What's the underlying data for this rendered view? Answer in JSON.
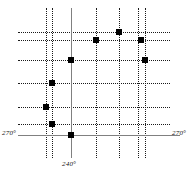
{
  "chart_data": {
    "type": "scatter",
    "title": "",
    "xlabel": "",
    "ylabel": "",
    "xlim": [
      0,
      193
    ],
    "ylim": [
      0,
      175
    ],
    "grid": true,
    "grid_style": "dotted",
    "legend": "none",
    "axis_color": "#808080",
    "grid_color": "#1a1a1a",
    "marker_color": "#000000",
    "marker_shape": "square",
    "annotations": [
      {
        "text": "270°",
        "position": "left-of-horizontal-axis"
      },
      {
        "text": "270°",
        "position": "right-of-horizontal-axis"
      },
      {
        "text": "240°",
        "position": "below-vertical-axis"
      }
    ],
    "axes": {
      "vertical_axis_x": 71,
      "horizontal_axis_y": 135,
      "vertical_axis_top": 8,
      "vertical_axis_bottom": 158,
      "horizontal_axis_left": 18,
      "horizontal_axis_right": 180
    },
    "gridlines_vertical_x": [
      46,
      52,
      96,
      119,
      138,
      145
    ],
    "gridlines_horizontal_y": [
      32,
      40,
      60,
      83,
      107,
      124
    ],
    "points": [
      {
        "x": 119,
        "y": 32
      },
      {
        "x": 96,
        "y": 40
      },
      {
        "x": 141,
        "y": 40
      },
      {
        "x": 71,
        "y": 60
      },
      {
        "x": 145,
        "y": 60
      },
      {
        "x": 52,
        "y": 83
      },
      {
        "x": 46,
        "y": 107
      },
      {
        "x": 52,
        "y": 124
      },
      {
        "x": 71,
        "y": 135
      }
    ]
  },
  "labels": {
    "left": "270°",
    "right": "270°",
    "bottom": "240°"
  }
}
